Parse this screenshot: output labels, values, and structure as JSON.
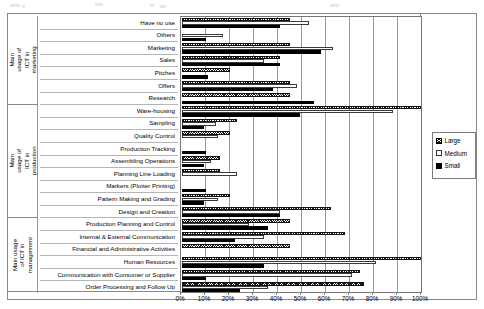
{
  "chart_data": {
    "type": "bar",
    "orientation": "horizontal",
    "title": "",
    "subtitle": "",
    "xlabel": "",
    "ylabel": "",
    "xlim": [
      0,
      100
    ],
    "xunit": "%",
    "grid": true,
    "legend_position": "right-outside",
    "xticks": [
      "0%",
      "10%",
      "20%",
      "30%",
      "40%",
      "50%",
      "60%",
      "70%",
      "80%",
      "90%",
      "100%"
    ],
    "xtick_values": [
      0,
      10,
      20,
      30,
      40,
      50,
      60,
      70,
      80,
      90,
      100
    ],
    "groups": [
      {
        "label": "Main usage of ICT in marketing",
        "categories": [
          "Have no use",
          "Others",
          "Marketing",
          "Sales",
          "Pitches",
          "Offers",
          "Research"
        ]
      },
      {
        "label": "Main usage of ICT in production",
        "categories": [
          "Ware-housing",
          "Sampling",
          "Quality Control",
          "Production Tracking",
          "Assembling Operations",
          "Planning Line Loading",
          "Markers (Plotter Printing)",
          "Pattern Making and Grading",
          "Design and Creation"
        ]
      },
      {
        "label": "Main usage of ICT in management",
        "categories": [
          "Production Planning and Control",
          "Internal & External Communication",
          "Financial and Administrative Activities",
          "Human Resources",
          "Communication with Consumer or Supplier",
          "Order Processing and Follow Up"
        ]
      }
    ],
    "categories": [
      "Have no use",
      "Others",
      "Marketing",
      "Sales",
      "Pitches",
      "Offers",
      "Research",
      "Ware-housing",
      "Sampling",
      "Quality Control",
      "Production Tracking",
      "Assembling Operations",
      "Planning Line Loading",
      "Markers (Plotter Printing)",
      "Pattern Making and Grading",
      "Design and Creation",
      "Production Planning and Control",
      "Internal & External Communication",
      "Financial and Administrative Activities",
      "Human Resources",
      "Communication with Consumer or Supplier",
      "Order Processing and Follow Up"
    ],
    "series": [
      {
        "name": "Large",
        "pattern": "crosshatch",
        "color": "#1a1a1a",
        "values": [
          45,
          0,
          45,
          41,
          20,
          45,
          45,
          100,
          23,
          20,
          0,
          16,
          16,
          0,
          20,
          62,
          45,
          68,
          45,
          100,
          74,
          76
        ]
      },
      {
        "name": "Medium",
        "pattern": "open",
        "color": "#ffffff",
        "values": [
          53,
          17,
          63,
          34,
          0,
          48,
          0,
          88,
          14,
          15,
          0,
          12,
          23,
          0,
          15,
          41,
          28,
          34,
          0,
          81,
          71,
          36
        ]
      },
      {
        "name": "Small",
        "pattern": "solid",
        "color": "#000000",
        "values": [
          41,
          10,
          58,
          41,
          11,
          38,
          55,
          49,
          9,
          0,
          10,
          9,
          0,
          10,
          9,
          41,
          36,
          22,
          0,
          34,
          10,
          24
        ]
      }
    ]
  },
  "legend": {
    "items": [
      {
        "label": "Large",
        "swatch": "crosshatch-swatch"
      },
      {
        "label": "Medium",
        "swatch": "open-swatch"
      },
      {
        "label": "Small",
        "swatch": "solid-swatch"
      }
    ]
  }
}
